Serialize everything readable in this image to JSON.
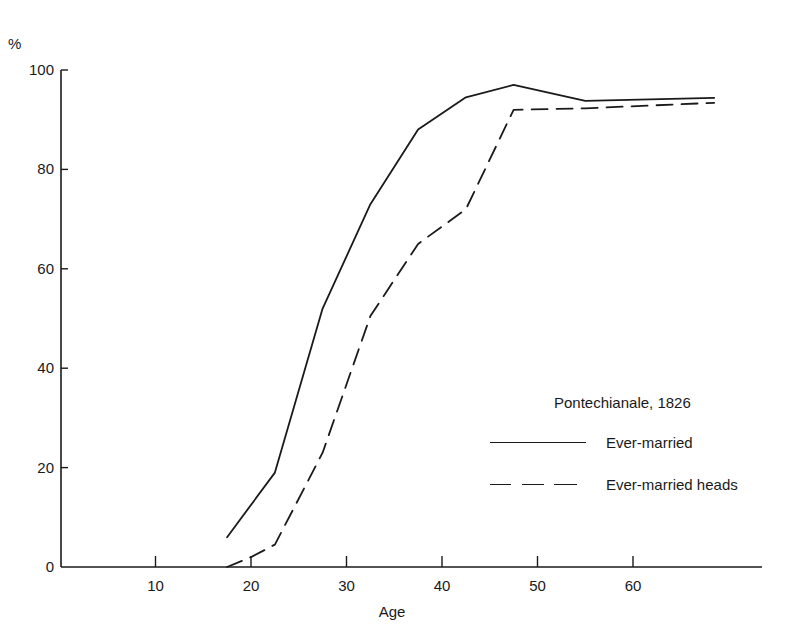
{
  "chart_data": {
    "type": "line",
    "title": "Pontechianale, 1826",
    "xlabel": "Age",
    "ylabel": "%",
    "xlim": [
      0,
      74
    ],
    "ylim": [
      0,
      100
    ],
    "x_ticks": [
      10,
      20,
      30,
      40,
      50,
      60
    ],
    "y_ticks": [
      0,
      20,
      40,
      60,
      80,
      100
    ],
    "grid": false,
    "legend_position": "lower right",
    "series": [
      {
        "name": "Ever-married",
        "style": "solid",
        "x": [
          17.5,
          22.5,
          27.5,
          32.5,
          37.5,
          42.5,
          47.5,
          55,
          68.5
        ],
        "y": [
          6,
          19,
          52,
          73,
          88,
          94.5,
          97,
          93.8,
          94.4
        ]
      },
      {
        "name": "Ever-married heads",
        "style": "dashed",
        "x": [
          17.5,
          20,
          22.5,
          27.5,
          32.5,
          37.5,
          42.5,
          47.5,
          55,
          68.5
        ],
        "y": [
          0,
          2,
          4.5,
          23,
          50.5,
          65,
          72,
          92,
          92.3,
          93.4
        ]
      }
    ]
  },
  "axes": {
    "y_unit": "%",
    "x_title": "Age",
    "x_tick_labels": [
      "10",
      "20",
      "30",
      "40",
      "50",
      "60"
    ],
    "y_tick_labels": [
      "0",
      "20",
      "40",
      "60",
      "80",
      "100"
    ]
  },
  "legend": {
    "title": "Pontechianale, 1826",
    "items": [
      {
        "label": "Ever-married",
        "style": "solid"
      },
      {
        "label": "Ever-married heads",
        "style": "dashed"
      }
    ]
  },
  "colors": {
    "ink": "#1a1a1a",
    "background": "#ffffff"
  }
}
